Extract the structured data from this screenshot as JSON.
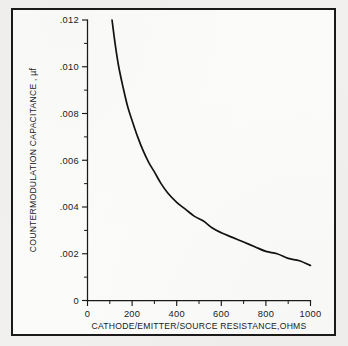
{
  "figure": {
    "background_color": "#f1f0ee",
    "panel_color": "#fbfbfa",
    "frame_color": "#1a1a1a",
    "curve_color": "#121212"
  },
  "chart_data": {
    "type": "line",
    "title": "",
    "subtitle": "",
    "xlabel": "CATHODE/EMITTER/SOURCE RESISTANCE,OHMS",
    "ylabel": "COUNTERMODULATION  CAPACITANCE , µf",
    "xlim": [
      0,
      1000
    ],
    "ylim": [
      0,
      0.012
    ],
    "grid": false,
    "legend": null,
    "x_ticks": [
      0,
      200,
      400,
      600,
      800,
      1000
    ],
    "x_tick_labels": [
      "0",
      "200",
      "400",
      "600",
      "800",
      "1000"
    ],
    "x_minor_ticks": [
      100,
      300,
      500,
      700,
      900
    ],
    "y_ticks": [
      0,
      0.002,
      0.004,
      0.006,
      0.008,
      0.01,
      0.012
    ],
    "y_tick_labels": [
      "0",
      ".002",
      ".004",
      ".006",
      ".008",
      ".010",
      ".012"
    ],
    "y_minor_ticks": [
      0.001,
      0.003,
      0.005,
      0.007,
      0.009,
      0.011
    ],
    "series": [
      {
        "name": "Countermodulation capacitance",
        "x": [
          110,
          125,
          140,
          160,
          180,
          200,
          225,
          250,
          275,
          300,
          330,
          360,
          400,
          440,
          480,
          520,
          560,
          600,
          650,
          700,
          750,
          800,
          850,
          900,
          950,
          1000
        ],
        "values": [
          0.012,
          0.0109,
          0.01,
          0.0091,
          0.0083,
          0.0077,
          0.007,
          0.0064,
          0.0059,
          0.0055,
          0.005,
          0.0046,
          0.0042,
          0.0039,
          0.0036,
          0.0034,
          0.0031,
          0.0029,
          0.0027,
          0.0025,
          0.0023,
          0.0021,
          0.002,
          0.0018,
          0.0017,
          0.0015
        ]
      }
    ],
    "annotations": []
  }
}
